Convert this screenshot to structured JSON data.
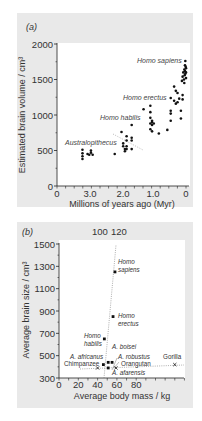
{
  "chart_data": [
    {
      "panel": "(a)",
      "type": "scatter",
      "xlabel": "Millions of years ago (Myr)",
      "ylabel": "Estimated brain volume / cm³",
      "xlim": [
        3.8,
        0
      ],
      "ylim": [
        0,
        2000
      ],
      "xticks": [
        "0",
        "3.0",
        "2.0",
        "1.0",
        "0"
      ],
      "yticks": [
        "0",
        "500",
        "1000",
        "1500",
        "2000"
      ],
      "grid": false,
      "group_labels": [
        {
          "text": "Australopithecus",
          "x": 3.25,
          "y": 620
        },
        {
          "text": "Homo habilis",
          "x": 1.55,
          "y": 960
        },
        {
          "text": "Homo erectus",
          "x": 0.85,
          "y": 1240
        },
        {
          "text": "Homo sapiens",
          "x": 0.55,
          "y": 1750
        }
      ],
      "points": [
        [
          3.05,
          510
        ],
        [
          3.05,
          460
        ],
        [
          3.05,
          420
        ],
        [
          3.05,
          380
        ],
        [
          2.9,
          450
        ],
        [
          2.85,
          440
        ],
        [
          2.8,
          470
        ],
        [
          2.8,
          500
        ],
        [
          2.75,
          440
        ],
        [
          2.1,
          450
        ],
        [
          1.9,
          760
        ],
        [
          1.85,
          600
        ],
        [
          1.85,
          560
        ],
        [
          1.8,
          520
        ],
        [
          1.8,
          490
        ],
        [
          1.75,
          700
        ],
        [
          1.75,
          640
        ],
        [
          1.75,
          560
        ],
        [
          1.75,
          520
        ],
        [
          1.6,
          860
        ],
        [
          1.6,
          680
        ],
        [
          1.6,
          640
        ],
        [
          1.6,
          520
        ],
        [
          1.25,
          1080
        ],
        [
          1.05,
          1130
        ],
        [
          1.05,
          1040
        ],
        [
          1.05,
          960
        ],
        [
          1.0,
          920
        ],
        [
          1.0,
          900
        ],
        [
          1.0,
          860
        ],
        [
          1.05,
          880
        ],
        [
          0.95,
          880
        ],
        [
          1.05,
          800
        ],
        [
          1.0,
          770
        ],
        [
          0.8,
          740
        ],
        [
          0.55,
          790
        ],
        [
          0.45,
          1240
        ],
        [
          0.45,
          1060
        ],
        [
          0.45,
          1020
        ],
        [
          0.45,
          920
        ],
        [
          0.35,
          1400
        ],
        [
          0.35,
          1200
        ],
        [
          0.3,
          1160
        ],
        [
          0.3,
          1340
        ],
        [
          0.25,
          1310
        ],
        [
          0.25,
          1180
        ],
        [
          0.2,
          1230
        ],
        [
          0.15,
          1060
        ],
        [
          0.15,
          950
        ],
        [
          0.12,
          1480
        ],
        [
          0.1,
          1280
        ],
        [
          0.1,
          1220
        ],
        [
          0.1,
          1540
        ],
        [
          0.08,
          1600
        ],
        [
          0.06,
          1500
        ],
        [
          0.05,
          1450
        ],
        [
          0.05,
          1640
        ],
        [
          0.04,
          1560
        ],
        [
          0.03,
          1700
        ],
        [
          0.03,
          1620
        ],
        [
          0.02,
          1760
        ],
        [
          0.02,
          1580
        ],
        [
          0.01,
          1680
        ],
        [
          0.0,
          1520
        ],
        [
          0.0,
          1600
        ],
        [
          0.0,
          1660
        ]
      ]
    },
    {
      "panel": "(b)",
      "type": "scatter",
      "xlabel": "Average body mass / kg",
      "ylabel": "Average brain size / cm³",
      "xlim": [
        0,
        140
      ],
      "ylim": [
        300,
        1500
      ],
      "xticks": [
        "0",
        "20",
        "40",
        "60",
        "80"
      ],
      "top_xticks": [
        "100",
        "120"
      ],
      "yticks": [
        "300",
        "500",
        "700",
        "900",
        "1100",
        "1300",
        "1500"
      ],
      "grid": false,
      "points": [
        {
          "name": "Homo sapiens",
          "x": 58,
          "y": 1250,
          "marker": "square"
        },
        {
          "name": "Homo erectus",
          "x": 56,
          "y": 850,
          "marker": "square"
        },
        {
          "name": "Homo habilis",
          "x": 47,
          "y": 650,
          "marker": "square"
        },
        {
          "name": "A. boisei",
          "x": 51,
          "y": 440,
          "marker": "square"
        },
        {
          "name": "A. africanus",
          "x": 46,
          "y": 420,
          "marker": "square"
        },
        {
          "name": "A. robustus",
          "x": 55,
          "y": 440,
          "marker": "square"
        },
        {
          "name": "A. afarensis",
          "x": 51,
          "y": 390,
          "marker": "square"
        },
        {
          "name": "Chimpanzee",
          "x": 40,
          "y": 390,
          "marker": "cross"
        },
        {
          "name": "Orangutan",
          "x": 59,
          "y": 390,
          "marker": "cross"
        },
        {
          "name": "Gorilla",
          "x": 120,
          "y": 420,
          "marker": "cross"
        }
      ]
    }
  ],
  "panel_a": {
    "label": "(a)",
    "ylabel": "Estimated brain volume / cm³",
    "xlabel": "Millions of years ago (Myr)",
    "yticks": [
      "0",
      "500",
      "1000",
      "1500",
      "2000"
    ],
    "xticks": [
      "0",
      "3.0",
      "2.0",
      "1.0",
      "0"
    ],
    "groups": [
      "Australopithecus",
      "Homo habilis",
      "Homo erectus",
      "Homo sapiens"
    ]
  },
  "panel_b": {
    "label": "(b)",
    "ylabel": "Average brain size / cm³",
    "xlabel": "Average body mass / kg",
    "yticks": [
      "300",
      "500",
      "700",
      "900",
      "1100",
      "1300",
      "1500"
    ],
    "xticks": [
      "0",
      "20",
      "40",
      "60",
      "80"
    ],
    "top_ticks": [
      "100",
      "120"
    ],
    "labels": {
      "sapiens_1": "Homo",
      "sapiens_2": "sapiens",
      "erectus_1": "Homo",
      "erectus_2": "erectus",
      "habilis_1": "Homo",
      "habilis_2": "habilis",
      "boisei": "A. boisei",
      "africanus": "A. africanus",
      "robustus": "A. robustus",
      "afarensis": "A. afarensis",
      "chimp": "Chimpanzee",
      "orang": "Orangutan",
      "gorilla": "Gorilla"
    }
  },
  "colors": {
    "panel_bg": "#e9e9e9",
    "plot_bg": "#ffffff",
    "ink": "#1a1a1a",
    "text": "#333333",
    "dotted": "#888888"
  }
}
